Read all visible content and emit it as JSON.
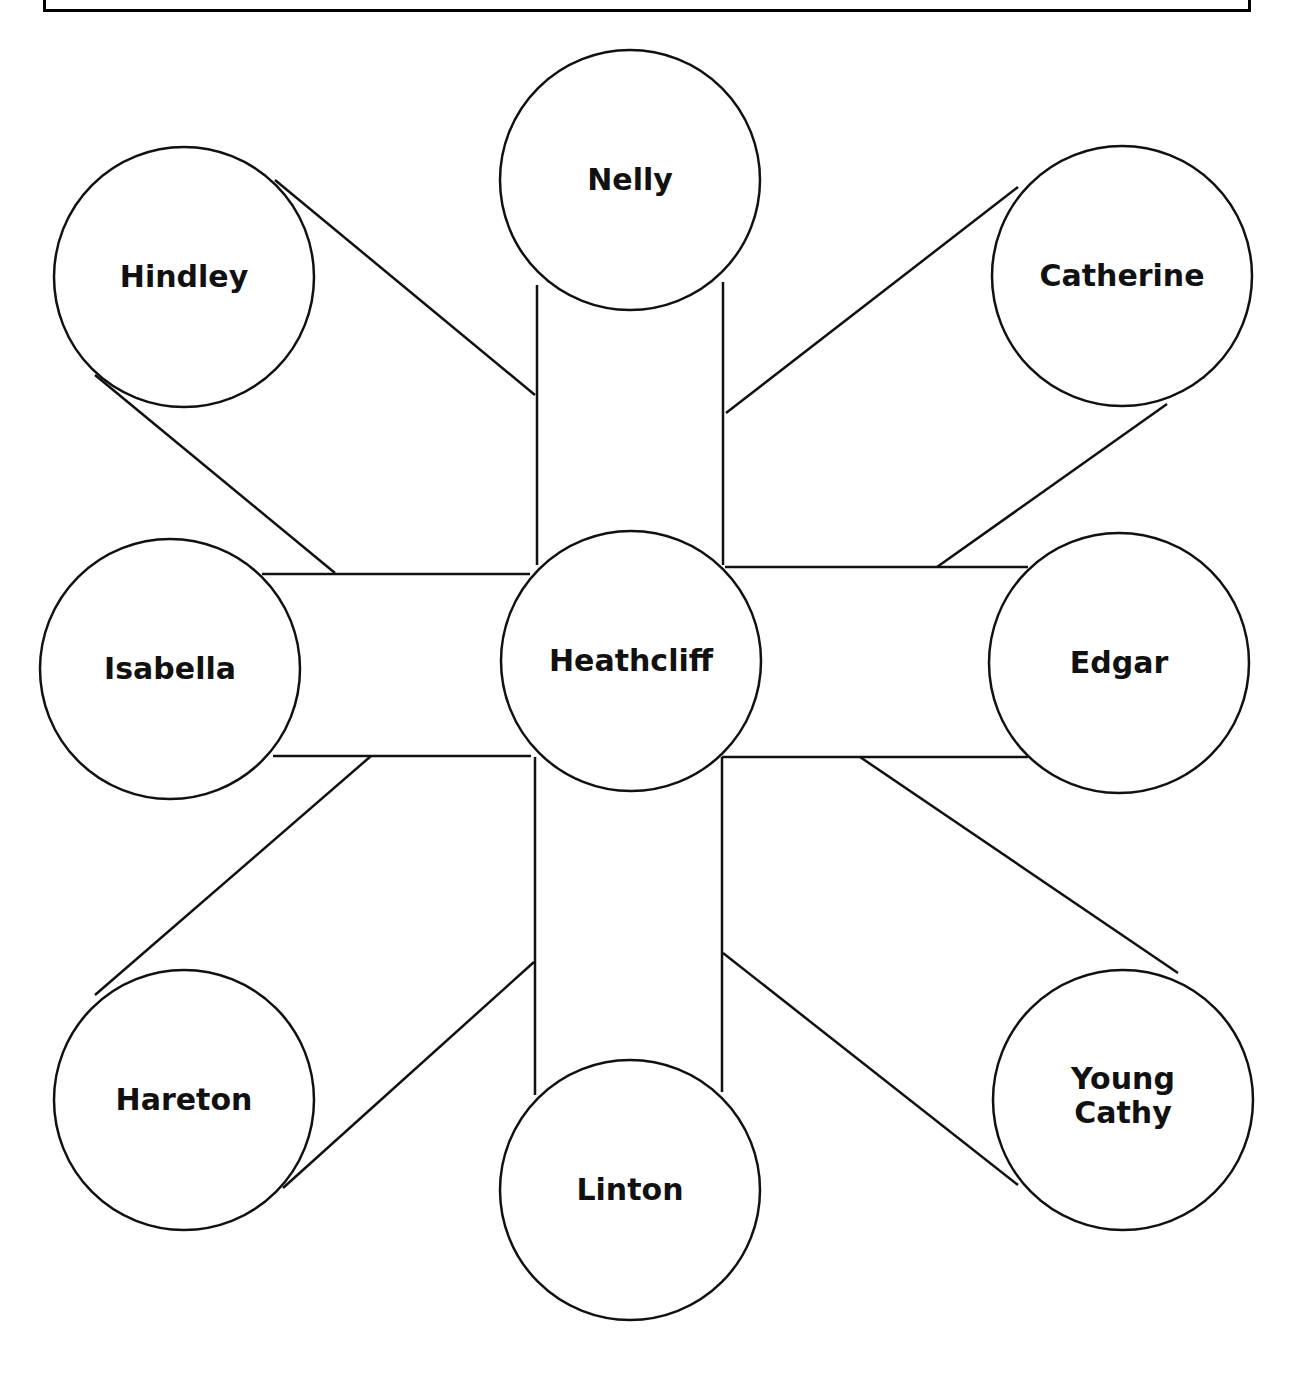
{
  "header": {
    "cropped_text": ""
  },
  "diagram": {
    "center": {
      "id": "heathcliff",
      "label": "Heathcliff",
      "cx": 631,
      "cy": 661,
      "r": 130
    },
    "nodes": [
      {
        "id": "nelly",
        "label": "Nelly",
        "lines": [
          "Nelly"
        ],
        "cx": 630,
        "cy": 180,
        "r": 130
      },
      {
        "id": "hindley",
        "label": "Hindley",
        "lines": [
          "Hindley"
        ],
        "cx": 184,
        "cy": 277,
        "r": 130
      },
      {
        "id": "catherine",
        "label": "Catherine",
        "lines": [
          "Catherine"
        ],
        "cx": 1122,
        "cy": 276,
        "r": 130
      },
      {
        "id": "isabella",
        "label": "Isabella",
        "lines": [
          "Isabella"
        ],
        "cx": 170,
        "cy": 669,
        "r": 130
      },
      {
        "id": "edgar",
        "label": "Edgar",
        "lines": [
          "Edgar"
        ],
        "cx": 1119,
        "cy": 663,
        "r": 130
      },
      {
        "id": "hareton",
        "label": "Hareton",
        "lines": [
          "Hareton"
        ],
        "cx": 184,
        "cy": 1100,
        "r": 130
      },
      {
        "id": "linton",
        "label": "Linton",
        "lines": [
          "Linton"
        ],
        "cx": 630,
        "cy": 1190,
        "r": 130
      },
      {
        "id": "young-cathy",
        "label": "Young Cathy",
        "lines": [
          "Young",
          "Cathy"
        ],
        "cx": 1123,
        "cy": 1100,
        "r": 130
      }
    ],
    "connectors": [
      {
        "to": "nelly",
        "lines": [
          [
            537,
            285,
            537,
            565
          ],
          [
            723,
            282,
            723,
            565
          ]
        ]
      },
      {
        "to": "linton",
        "lines": [
          [
            535,
            757,
            535,
            1095
          ],
          [
            722,
            757,
            722,
            1092
          ]
        ]
      },
      {
        "to": "isabella",
        "lines": [
          [
            262,
            574,
            530,
            574
          ],
          [
            273,
            756,
            531,
            756
          ]
        ]
      },
      {
        "to": "edgar",
        "lines": [
          [
            725,
            567,
            1028,
            567
          ],
          [
            722,
            757,
            1028,
            757
          ]
        ]
      },
      {
        "to": "hindley",
        "lines": [
          [
            275,
            180,
            535,
            395
          ],
          [
            95,
            375,
            335,
            573
          ]
        ]
      },
      {
        "to": "catherine",
        "lines": [
          [
            1018,
            187,
            726,
            413
          ],
          [
            1167,
            404,
            937,
            567
          ]
        ]
      },
      {
        "to": "hareton",
        "lines": [
          [
            95,
            995,
            371,
            756
          ],
          [
            283,
            1188,
            534,
            962
          ]
        ]
      },
      {
        "to": "young-cathy",
        "lines": [
          [
            860,
            757,
            1178,
            973
          ],
          [
            723,
            953,
            1018,
            1185
          ]
        ]
      }
    ],
    "stroke_color": "#111111",
    "fill_color": "#ffffff"
  }
}
